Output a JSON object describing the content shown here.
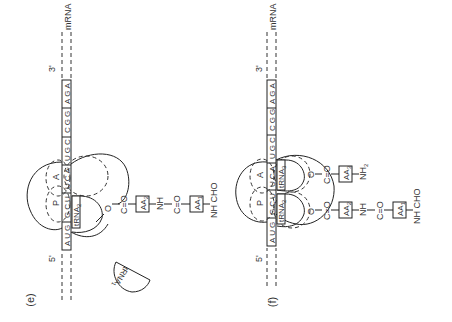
{
  "panels": [
    {
      "label": "(e)",
      "mrna": {
        "label": "mRNA",
        "five_prime": "5'",
        "three_prime": "3'",
        "codons": [
          "AUG",
          "GCU",
          "UCA",
          "UGC",
          "CGG",
          "AGA"
        ]
      },
      "ribosome_sites": {
        "p": "P",
        "a": "A"
      },
      "trnas": [
        {
          "name": "tRNA",
          "sub": "2"
        }
      ],
      "free_trna": {
        "name": "tRNA",
        "sub": "1"
      },
      "chain": [
        "O",
        "C=O",
        "AA2",
        "NH",
        "C=O",
        "AA1",
        "NH CHO"
      ]
    },
    {
      "label": "(f)",
      "mrna": {
        "label": "mRNA",
        "five_prime": "5'",
        "three_prime": "3'",
        "codons": [
          "AUG",
          "GCU",
          "UCA",
          "UGC",
          "CGG",
          "AGA"
        ]
      },
      "ribosome_sites": {
        "p": "P",
        "a": "A"
      },
      "trnas": [
        {
          "name": "tRNA",
          "sub": "2"
        },
        {
          "name": "tRNA",
          "sub": "3"
        }
      ],
      "chain_p": [
        "O",
        "C=O",
        "AA2",
        "NH",
        "C=O",
        "AA1",
        "NH CHO"
      ],
      "chain_a": [
        "O",
        "C=O",
        "AA3",
        "NH2"
      ]
    }
  ]
}
